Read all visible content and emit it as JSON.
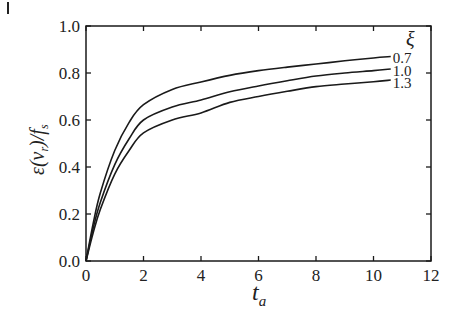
{
  "figure": {
    "corner_mark": "|"
  },
  "chart_data": {
    "type": "line",
    "title": "",
    "xlabel": "t_a",
    "xlabel_main": "t",
    "xlabel_sub": "a",
    "ylabel": "ε(v_r)/f_s",
    "ylabel_parts": {
      "eps": "ε(",
      "v": "v",
      "r": "r",
      "close": ")/",
      "f": "f",
      "s": "s"
    },
    "xlim": [
      0,
      12
    ],
    "ylim": [
      0.0,
      1.0
    ],
    "xticks": [
      0,
      2,
      4,
      6,
      8,
      10,
      12
    ],
    "xtick_labels": [
      "0",
      "2",
      "4",
      "6",
      "8",
      "10",
      "12"
    ],
    "yticks": [
      0.0,
      0.2,
      0.4,
      0.6,
      0.8,
      1.0
    ],
    "ytick_labels": [
      "0.0",
      "0.2",
      "0.4",
      "0.6",
      "0.8",
      "1.0"
    ],
    "grid": false,
    "legend": {
      "title": "ξ",
      "position": "inline-right",
      "entries": [
        "0.7",
        "1.0",
        "1.3"
      ]
    },
    "x": [
      0,
      0.25,
      0.5,
      1,
      1.5,
      2,
      3,
      4,
      5,
      6,
      7,
      8,
      9,
      10,
      10.6
    ],
    "series": [
      {
        "name": "ξ = 0.7",
        "label": "0.7",
        "values": [
          0,
          0.16,
          0.29,
          0.47,
          0.59,
          0.665,
          0.73,
          0.762,
          0.79,
          0.81,
          0.825,
          0.838,
          0.852,
          0.864,
          0.87
        ]
      },
      {
        "name": "ξ = 1.0",
        "label": "1.0",
        "values": [
          0,
          0.14,
          0.25,
          0.41,
          0.52,
          0.6,
          0.655,
          0.685,
          0.72,
          0.745,
          0.767,
          0.787,
          0.8,
          0.81,
          0.817
        ]
      },
      {
        "name": "ξ = 1.3",
        "label": "1.3",
        "values": [
          0,
          0.12,
          0.22,
          0.37,
          0.47,
          0.545,
          0.6,
          0.63,
          0.675,
          0.7,
          0.722,
          0.742,
          0.753,
          0.763,
          0.77
        ]
      }
    ]
  }
}
